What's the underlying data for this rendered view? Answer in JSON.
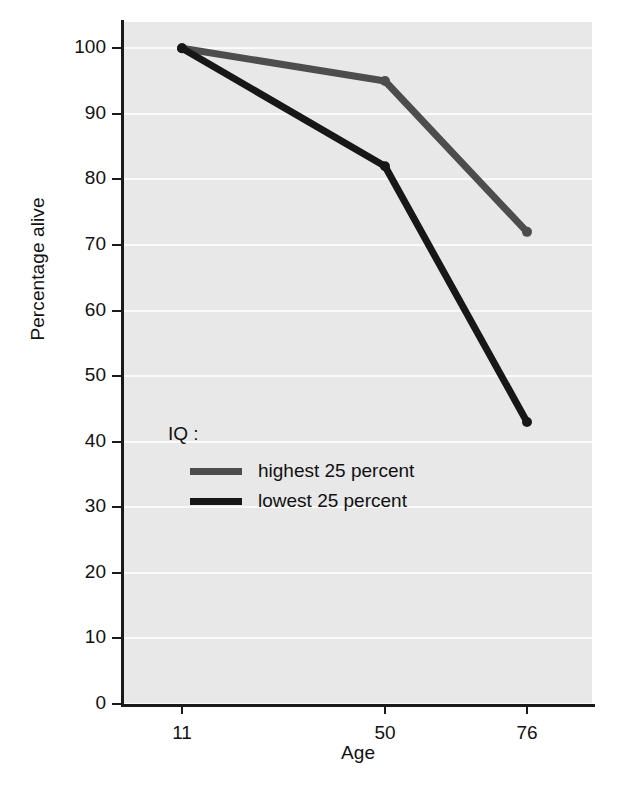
{
  "chart_data": {
    "type": "line",
    "title": "",
    "xlabel": "Age",
    "ylabel": "Percentage alive",
    "x": [
      11,
      50,
      76
    ],
    "xtick_labels": [
      "11",
      "50",
      "76"
    ],
    "ytick_labels": [
      "0",
      "10",
      "20",
      "30",
      "40",
      "50",
      "60",
      "70",
      "80",
      "90",
      "100"
    ],
    "yticks": [
      0,
      10,
      20,
      30,
      40,
      50,
      60,
      70,
      80,
      90,
      100
    ],
    "ylim": [
      0,
      104
    ],
    "grid": true,
    "legend_position": "inside-left",
    "legend_title": "IQ :",
    "series": [
      {
        "name": "highest 25 percent",
        "values": [
          100,
          95,
          72
        ],
        "color": "#4d4d4d"
      },
      {
        "name": "lowest 25 percent",
        "values": [
          100,
          82,
          43
        ],
        "color": "#171717"
      }
    ],
    "colors": {
      "plot_background": "#e8e8e8",
      "gridline": "#fbfbfb",
      "axis": "#1a1a1a",
      "text": "#111111"
    }
  }
}
